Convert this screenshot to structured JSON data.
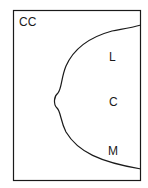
{
  "diagram": {
    "view_label": "CC",
    "regions": [
      {
        "label": "L"
      },
      {
        "label": "C"
      },
      {
        "label": "M"
      }
    ],
    "stroke_color": "#1a1a1a",
    "background": "#ffffff"
  }
}
